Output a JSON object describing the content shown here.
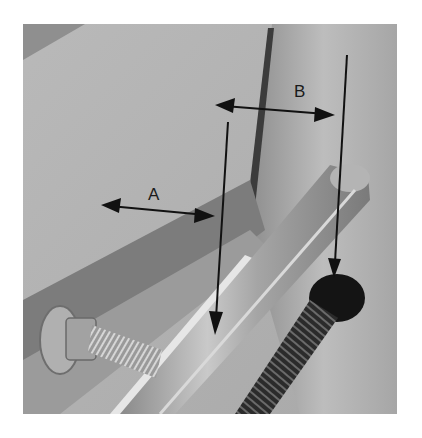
{
  "figure": {
    "labels": {
      "a": "A",
      "b": "B"
    },
    "annotations": [
      {
        "id": "A",
        "type": "double-arrow",
        "from": [
          101,
          205
        ],
        "to": [
          215,
          216
        ]
      },
      {
        "id": "B",
        "type": "double-arrow",
        "from": [
          215,
          105
        ],
        "to": [
          335,
          115
        ]
      },
      {
        "id": "arrow-1",
        "type": "arrow",
        "from": [
          228,
          122
        ],
        "to": [
          215,
          335
        ]
      },
      {
        "id": "arrow-2",
        "type": "arrow",
        "from": [
          347,
          55
        ],
        "to": [
          334,
          278
        ]
      }
    ],
    "colors": {
      "background": "#ffffff",
      "annotation": "#111111"
    }
  }
}
